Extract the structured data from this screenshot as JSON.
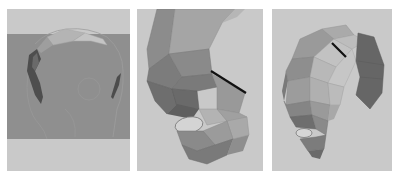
{
  "figure": {
    "panels": [
      {
        "id": "panel-1",
        "description": "Side view of head reference with partial polygon strip along the brow/top",
        "background": "#c9c9c9",
        "band_color": "#8f8f8f"
      },
      {
        "id": "panel-2",
        "description": "Polygon mesh of forehead and eye socket region with black edge highlight",
        "background": "#c9c9c9",
        "highlight_edge_color": "#111111"
      },
      {
        "id": "panel-3",
        "description": "Extended polygon mesh around skull with separate dark side patch and black edge highlight",
        "background": "#c9c9c9",
        "patch_color": "#666666",
        "highlight_edge_color": "#111111"
      }
    ]
  }
}
